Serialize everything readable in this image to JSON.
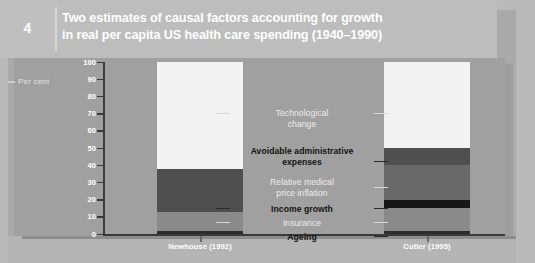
{
  "figure": {
    "number": "4",
    "title_line1": "Two estimates of causal factors accounting for growth",
    "title_line2": "in real per capita US health care spending (1940–1990)"
  },
  "axis": {
    "y_title": "Per cent",
    "y_ticks": [
      "100",
      "90",
      "80",
      "70",
      "60",
      "50",
      "40",
      "30",
      "20",
      "10",
      "0"
    ],
    "y_min": 0,
    "y_max": 100
  },
  "legend_labels": [
    {
      "id": "technological-change",
      "text": "Technological\nchange",
      "style": "light"
    },
    {
      "id": "avoidable-administrative-expenses",
      "text": "Avoidable administrative\nexpenses",
      "style": "dark"
    },
    {
      "id": "relative-medical-price-inflation",
      "text": "Relative medical\nprice inflation",
      "style": "light"
    },
    {
      "id": "income-growth",
      "text": "Income growth",
      "style": "dark"
    },
    {
      "id": "insurance",
      "text": "Insurance",
      "style": "light"
    },
    {
      "id": "ageing",
      "text": "Ageing",
      "style": "dark"
    }
  ],
  "colors": {
    "technological_change": "#f2f2f2",
    "avoidable_administrative_expenses": "#4f4f4f",
    "relative_medical_price_inflation": "#696969",
    "income_growth": "#171717",
    "insurance": "#8a8a8a",
    "ageing": "#2e2e2e",
    "plot_background": "#a0a0a0",
    "header_background": "#bdbdbd",
    "axis": "#3a3a3a",
    "title_text": "#ffffff"
  },
  "chart_data": {
    "type": "bar",
    "title": "Two estimates of causal factors accounting for growth in real per capita US health care spending (1940–1990)",
    "xlabel": "",
    "ylabel": "Per cent",
    "ylim": [
      0,
      100
    ],
    "grid": false,
    "stacked": true,
    "legend_position": "center-inside",
    "categories": [
      "Newhouse (1992)",
      "Cutler (1995)"
    ],
    "series": [
      {
        "name": "Ageing",
        "values": [
          2,
          2
        ]
      },
      {
        "name": "Insurance",
        "values": [
          11,
          13
        ]
      },
      {
        "name": "Income growth",
        "values": [
          0,
          5
        ]
      },
      {
        "name": "Relative medical price inflation",
        "values": [
          0,
          20
        ]
      },
      {
        "name": "Avoidable administrative expenses",
        "values": [
          25,
          10
        ]
      },
      {
        "name": "Technological change",
        "values": [
          62,
          50
        ]
      }
    ]
  }
}
